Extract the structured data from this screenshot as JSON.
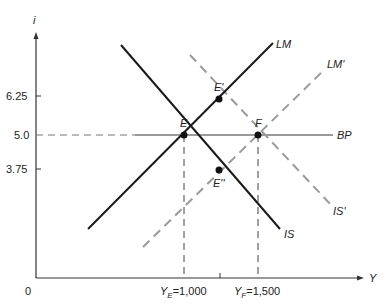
{
  "diagram": {
    "axes": {
      "y_label": "i",
      "x_label": "Y",
      "origin_label": "0"
    },
    "y_ticks": [
      {
        "label": "6.25",
        "value": 6.25
      },
      {
        "label": "5.0",
        "value": 5.0
      },
      {
        "label": "3.75",
        "value": 3.75
      }
    ],
    "x_ticks": [
      {
        "sym": "Y",
        "sub": "E",
        "rest": "=1,000",
        "value": 1000
      },
      {
        "sym": "Y",
        "sub": "F",
        "rest": "=1,500",
        "value": 1500
      }
    ],
    "curves": {
      "LM": {
        "label": "LM",
        "style": "solid",
        "color": "#1a1a1a"
      },
      "IS": {
        "label": "IS",
        "style": "solid",
        "color": "#1a1a1a"
      },
      "LM_prime": {
        "label": "LM'",
        "style": "dashed",
        "color": "#9a9a9a"
      },
      "IS_prime": {
        "label": "IS'",
        "style": "dashed",
        "color": "#9a9a9a"
      },
      "BP": {
        "label": "BP",
        "style": "solid",
        "color": "#9a9a9a"
      }
    },
    "points": {
      "E": {
        "label": "E",
        "Y": 1000,
        "i": 5.0
      },
      "E_prime": {
        "label": "E'",
        "Y": 1250,
        "i": 6.25
      },
      "F": {
        "label": "F",
        "Y": 1500,
        "i": 5.0
      },
      "E_double_prime": {
        "label": "E''",
        "Y": 1250,
        "i": 3.75
      }
    }
  }
}
